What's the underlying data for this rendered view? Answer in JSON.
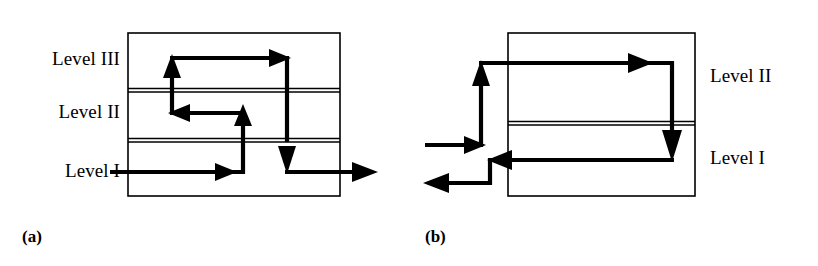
{
  "figure": {
    "width": 818,
    "height": 266,
    "background": "#ffffff",
    "ink_color": "#000000"
  },
  "panels": [
    {
      "id": "a",
      "caption": "(a)",
      "caption_pos": {
        "x": 22,
        "y": 228
      },
      "box": {
        "x": 128,
        "y": 33,
        "width": 212,
        "height": 163
      },
      "separators": [
        {
          "name": "separator-level3-level2",
          "y": 90
        },
        {
          "name": "separator-level2-level1",
          "y": 140
        }
      ],
      "labels": [
        {
          "name": "level-label-iii",
          "text": "Level III",
          "x": 32,
          "y": 49,
          "width": 88,
          "align": "right"
        },
        {
          "name": "level-label-ii",
          "text": "Level II",
          "x": 32,
          "y": 102,
          "width": 88,
          "align": "right"
        },
        {
          "name": "level-label-i",
          "text": "Level I",
          "x": 32,
          "y": 161,
          "width": 88,
          "align": "right"
        }
      ],
      "bands": [
        "Level III",
        "Level II",
        "Level I"
      ],
      "path_description": "Enters Level I from the left, runs right, rises through the lower separator into Level II, runs left, rises through the upper separator into Level III, runs right, then descends through both separators back to Level I and exits to the right.",
      "entry_side": "left",
      "entry_level": "Level I",
      "exit_side": "right",
      "exit_level": "Level I"
    },
    {
      "id": "b",
      "caption": "(b)",
      "caption_pos": {
        "x": 425,
        "y": 228
      },
      "box": {
        "x": 508,
        "y": 33,
        "width": 187,
        "height": 163
      },
      "separators": [
        {
          "name": "separator-level2-level1",
          "y": 123
        }
      ],
      "labels": [
        {
          "name": "level-label-ii",
          "text": "Level II",
          "x": 710,
          "y": 66,
          "width": 95,
          "align": "left"
        },
        {
          "name": "level-label-i",
          "text": "Level I",
          "x": 710,
          "y": 148,
          "width": 95,
          "align": "left"
        }
      ],
      "bands": [
        "Level II",
        "Level I"
      ],
      "path_description": "Enters from the left, rises to Level II, runs right across the block, descends through the separator into Level I, runs left out of the block, then steps down and exits to the left.",
      "entry_side": "left",
      "entry_level": "Level II",
      "exit_side": "left",
      "exit_level": "Level I"
    }
  ],
  "style": {
    "box_stroke_width": 1.6,
    "separator_stroke_width": 1.3,
    "separator_gap": 3,
    "path_stroke_width": 4.2,
    "arrowhead_length": 17,
    "arrowhead_halfwidth": 9
  }
}
